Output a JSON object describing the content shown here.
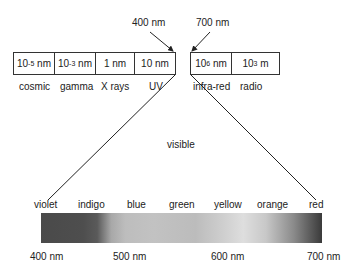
{
  "arrows": {
    "left_label": "400 nm",
    "right_label": "700 nm"
  },
  "left_box": {
    "cells": [
      {
        "base": "10",
        "exp": "-5",
        "unit": " nm"
      },
      {
        "base": "10",
        "exp": "-3",
        "unit": " nm"
      },
      {
        "base": "1 nm",
        "exp": "",
        "unit": ""
      },
      {
        "base": "10 nm",
        "exp": "",
        "unit": ""
      }
    ],
    "labels": [
      "cosmic",
      "gamma",
      "X rays",
      "UV"
    ]
  },
  "right_box": {
    "cells": [
      {
        "base": "10",
        "exp": "6",
        "unit": " nm"
      },
      {
        "base": "10",
        "exp": "3",
        "unit": " m"
      }
    ],
    "labels": [
      "infra-red",
      "radio"
    ]
  },
  "visible_label": "visible",
  "spectrum": {
    "colors": [
      "violet",
      "indigo",
      "blue",
      "green",
      "yellow",
      "orange",
      "red"
    ],
    "wavelengths": [
      "400 nm",
      "500 nm",
      "600 nm",
      "700 nm"
    ]
  }
}
